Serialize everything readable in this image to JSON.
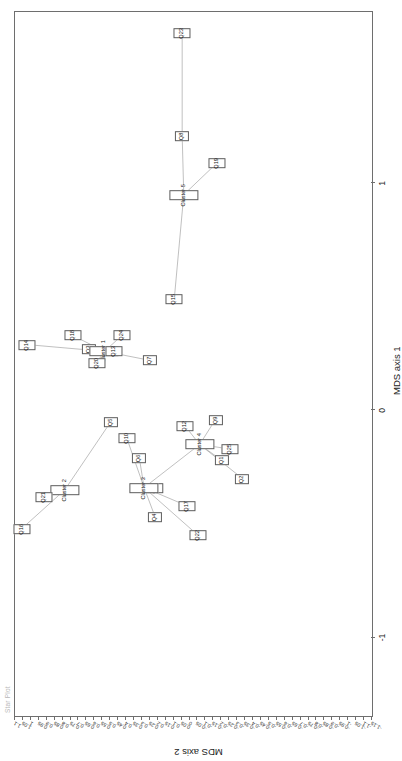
{
  "plot": {
    "title": "Star Plot",
    "x_axis_label": "MDS axis 1",
    "y_axis_label": "MDS axis 2"
  },
  "chart_data": {
    "type": "scatter",
    "title": "Star Plot",
    "xlabel": "MDS axis 1",
    "ylabel": "MDS axis 2",
    "xlim": [
      -1.35,
      1.75
    ],
    "ylim": [
      -1.15,
      1.1
    ],
    "grid": false,
    "legend": "none",
    "x_ticks": [
      -1,
      0,
      1
    ],
    "x_tick_labels": [
      "-1",
      "0",
      "1"
    ],
    "y_ticks": [
      1.1,
      1.05,
      1,
      0.95,
      0.9,
      0.85,
      0.8,
      0.75,
      0.7,
      0.65,
      0.6,
      0.55,
      0.5,
      0.45,
      0.4,
      0.35,
      0.3,
      0.25,
      0.2,
      0.15,
      0.1,
      0.05,
      0,
      -0.05,
      -0.1,
      -0.15,
      -0.2,
      -0.25,
      -0.3,
      -0.35,
      -0.4,
      -0.45,
      -0.5,
      -0.55,
      -0.6,
      -0.65,
      -0.7,
      -0.75,
      -0.8,
      -0.85,
      -0.9,
      -0.95,
      -1,
      -1.05,
      -1.1,
      -1.15
    ],
    "y_tick_labels": [
      "1.1",
      "1.05",
      "1",
      "0.95",
      "0.9",
      "0.85",
      "0.8",
      "0.75",
      "0.7",
      "0.65",
      "0.6",
      "0.55",
      "0.5",
      "0.45",
      "0.4",
      "0.35",
      "0.3",
      "0.25",
      "0.2",
      "0.15",
      "0.1",
      "0.05",
      "0",
      "-0.05",
      "-0.1",
      "-0.15",
      "-0.2",
      "-0.25",
      "-0.3",
      "-0.35",
      "-0.4",
      "-0.45",
      "-0.5",
      "-0.55",
      "-0.6",
      "-0.65",
      "-0.7",
      "-0.75",
      "-0.8",
      "-0.85",
      "-0.9",
      "-0.95",
      "-1",
      "-1.05",
      "-1.1",
      "-1.15"
    ],
    "points": [
      {
        "label": "Q23",
        "x": 1.66,
        "y": 0.04
      },
      {
        "label": "Q8",
        "x": 1.21,
        "y": 0.04
      },
      {
        "label": "Q19",
        "x": 1.09,
        "y": -0.18
      },
      {
        "label": "Cluster 5",
        "x": 0.95,
        "y": 0.03
      },
      {
        "label": "Q15",
        "x": 0.49,
        "y": 0.09
      },
      {
        "label": "Q24",
        "x": 0.33,
        "y": 0.42
      },
      {
        "label": "Q18",
        "x": 0.33,
        "y": 0.73
      },
      {
        "label": "Q14",
        "x": 0.29,
        "y": 1.02
      },
      {
        "label": "Q3",
        "x": 0.27,
        "y": 0.63
      },
      {
        "label": "Cluster 1",
        "x": 0.26,
        "y": 0.53
      },
      {
        "label": "Q13",
        "x": 0.26,
        "y": 0.47
      },
      {
        "label": "Q20",
        "x": 0.21,
        "y": 0.58
      },
      {
        "label": "Q7",
        "x": 0.22,
        "y": 0.24
      },
      {
        "label": "Q5",
        "x": -0.05,
        "y": 0.49
      },
      {
        "label": "Q10",
        "x": -0.12,
        "y": 0.39
      },
      {
        "label": "Q12",
        "x": -0.07,
        "y": 0.02
      },
      {
        "label": "Q9",
        "x": -0.04,
        "y": -0.17
      },
      {
        "label": "Cluster 4",
        "x": -0.15,
        "y": -0.07
      },
      {
        "label": "Q25",
        "x": -0.17,
        "y": -0.26
      },
      {
        "label": "Q1",
        "x": -0.22,
        "y": -0.21
      },
      {
        "label": "Q6",
        "x": -0.21,
        "y": 0.31
      },
      {
        "label": "Q2",
        "x": -0.3,
        "y": -0.34
      },
      {
        "label": "Q11",
        "x": -0.34,
        "y": 0.21
      },
      {
        "label": "Cluster 3",
        "x": -0.34,
        "y": 0.28
      },
      {
        "label": "Cluster 2",
        "x": -0.35,
        "y": 0.78
      },
      {
        "label": "Q21",
        "x": -0.38,
        "y": 0.91
      },
      {
        "label": "Q17",
        "x": -0.42,
        "y": 0.01
      },
      {
        "label": "Q4",
        "x": -0.47,
        "y": 0.21
      },
      {
        "label": "Q16",
        "x": -0.52,
        "y": 1.05
      },
      {
        "label": "Q22",
        "x": -0.55,
        "y": -0.06
      }
    ],
    "edges": [
      [
        "Cluster 5",
        "Q8"
      ],
      [
        "Q8",
        "Q23"
      ],
      [
        "Cluster 5",
        "Q19"
      ],
      [
        "Cluster 5",
        "Q15"
      ],
      [
        "Cluster 1",
        "Q18"
      ],
      [
        "Cluster 1",
        "Q24"
      ],
      [
        "Cluster 1",
        "Q13"
      ],
      [
        "Cluster 1",
        "Q3"
      ],
      [
        "Cluster 1",
        "Q20"
      ],
      [
        "Cluster 1",
        "Q14"
      ],
      [
        "Cluster 1",
        "Q7"
      ],
      [
        "Cluster 2",
        "Q5"
      ],
      [
        "Cluster 2",
        "Q21"
      ],
      [
        "Cluster 2",
        "Q16"
      ],
      [
        "Cluster 3",
        "Q10"
      ],
      [
        "Cluster 3",
        "Q6"
      ],
      [
        "Cluster 3",
        "Q11"
      ],
      [
        "Cluster 3",
        "Q4"
      ],
      [
        "Cluster 3",
        "Q17"
      ],
      [
        "Cluster 3",
        "Q22"
      ],
      [
        "Cluster 3",
        "Cluster 4"
      ],
      [
        "Cluster 4",
        "Q12"
      ],
      [
        "Cluster 4",
        "Q9"
      ],
      [
        "Cluster 4",
        "Q25"
      ],
      [
        "Cluster 4",
        "Q1"
      ],
      [
        "Cluster 4",
        "Q2"
      ]
    ]
  }
}
